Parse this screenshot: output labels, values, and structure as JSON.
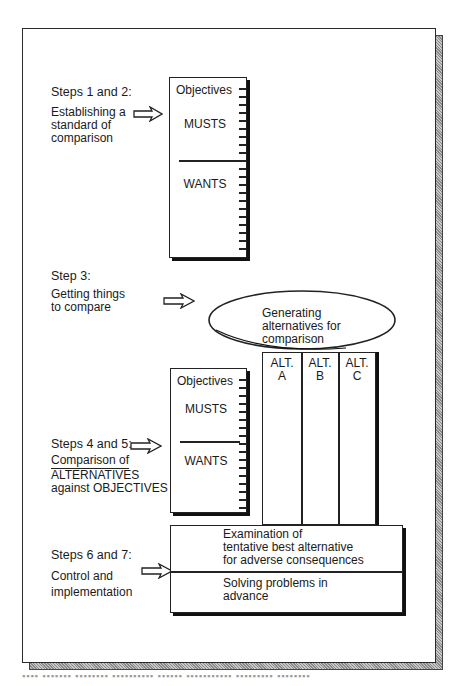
{
  "figure": {
    "steps_1_2": {
      "title": "Steps 1 and 2:",
      "desc_lines": [
        "Establishing a",
        "standard of",
        "comparison"
      ]
    },
    "objectives_box_top": {
      "header": "Objectives",
      "musts": "MUSTS",
      "wants": "WANTS"
    },
    "step_3": {
      "title": "Step 3:",
      "desc_lines": [
        "Getting things",
        "to compare"
      ]
    },
    "ellipse": {
      "lines": [
        "Generating",
        "alternatives for",
        "comparison"
      ]
    },
    "alternatives": [
      {
        "line1": "ALT.",
        "line2": "A"
      },
      {
        "line1": "ALT.",
        "line2": "B"
      },
      {
        "line1": "ALT.",
        "line2": "C"
      }
    ],
    "objectives_box_bottom": {
      "header": "Objectives",
      "musts": "MUSTS",
      "wants": "WANTS"
    },
    "steps_4_5": {
      "title": "Steps 4 and 5:",
      "desc_lines": [
        "Comparison of",
        "ALTERNATIVES",
        "against OBJECTIVES"
      ]
    },
    "steps_6_7": {
      "title": "Steps 6 and 7:",
      "desc_lines": [
        "Control and",
        "implementation"
      ]
    },
    "control_box": {
      "top_lines": [
        "Examination of",
        "tentative best alternative",
        "for adverse consequences"
      ],
      "bottom_lines": [
        "Solving problems in",
        "advance"
      ]
    },
    "caption": "▪▪▪▪ ▪▪▪▪▪▪▪ ▪▪▪▪▪▪▪▪ ▪▪▪▪▪▪▪▪▪▪ ▪▪▪▪▪▪ ▪▪▪▪▪▪▪▪▪▪▪ ▪▪▪▪▪▪▪▪▪ ▪▪▪▪▪▪▪▪"
  },
  "colors": {
    "ink": "#1a1a1a",
    "shadow_hatch": "#a0a0a0",
    "paper": "#ffffff"
  }
}
